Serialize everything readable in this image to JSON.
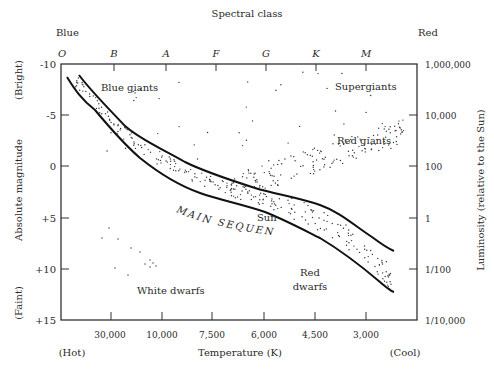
{
  "title": "Spectral class",
  "top_left_label": "Blue",
  "top_right_label": "Red",
  "spectral_classes": [
    "O",
    "B",
    "A",
    "F",
    "G",
    "K",
    "M"
  ],
  "left_axis": {
    "title": "Absolute magnitude",
    "bright_label": "(Bright)",
    "faint_label": "(Faint)",
    "ticks": [
      "-10",
      "-5",
      "0",
      "+5",
      "+10",
      "+15"
    ]
  },
  "right_axis": {
    "title": "Luminosity (relative to the Sun)",
    "ticks": [
      "1,000,000",
      "10,000",
      "100",
      "1",
      "1/100",
      "1/10,000"
    ]
  },
  "bottom_axis": {
    "title": "Temperature (K)",
    "hot_label": "(Hot)",
    "cool_label": "(Cool)",
    "ticks": [
      "30,000",
      "10,000",
      "7,500",
      "6,000",
      "4,500",
      "3,000"
    ]
  },
  "regions": {
    "blue_giants": "Blue giants",
    "supergiants": "Supergiants",
    "red_giants": "Red giants",
    "sun": "Sun",
    "main_sequence": "MAIN SEQUENCE",
    "white_dwarfs": "White dwarfs",
    "red_dwarfs_line1": "Red",
    "red_dwarfs_line2": "dwarfs"
  },
  "chart_data": {
    "type": "scatter",
    "xlabel": "Temperature (K)",
    "ylabel": "Absolute magnitude",
    "y2label": "Luminosity (relative to the Sun)",
    "x_top_label": "Spectral class",
    "x_ticks": [
      "30,000",
      "10,000",
      "7,500",
      "6,000",
      "4,500",
      "3,000"
    ],
    "x_top_ticks": [
      "O",
      "B",
      "A",
      "F",
      "G",
      "K",
      "M"
    ],
    "y_ticks": [
      -10,
      -5,
      0,
      5,
      10,
      15
    ],
    "y2_ticks": [
      "1,000,000",
      "10,000",
      "100",
      "1",
      "1/100",
      "1/10,000"
    ],
    "ylim": [
      15,
      -10
    ],
    "grid": false,
    "annotations": [
      "Blue giants",
      "Supergiants",
      "Red giants",
      "Sun",
      "MAIN SEQUENCE",
      "White dwarfs",
      "Red dwarfs",
      "Blue",
      "Red",
      "(Hot)",
      "(Cool)",
      "(Bright)",
      "(Faint)"
    ]
  }
}
